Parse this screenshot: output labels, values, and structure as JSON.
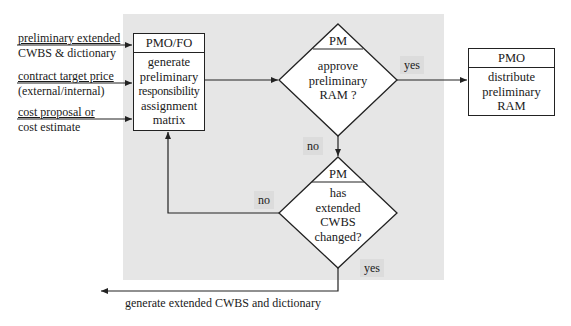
{
  "inputs": [
    {
      "line1": "preliminary extended",
      "line2": "CWBS & dictionary"
    },
    {
      "line1": "contract target price",
      "line2": "(external/internal)"
    },
    {
      "line1": "cost proposal or",
      "line2": "cost estimate"
    }
  ],
  "process_box": {
    "role": "PMO/FO",
    "lines": [
      "generate",
      "preliminary",
      "responsibility",
      "assignment",
      "matrix"
    ]
  },
  "decision_approve": {
    "role": "PM",
    "lines": [
      "approve",
      "preliminary",
      "RAM ?"
    ],
    "yes_label": "yes",
    "no_label": "no"
  },
  "decision_changed": {
    "role": "PM",
    "lines": [
      "has",
      "extended",
      "CWBS",
      "changed?"
    ],
    "yes_label": "yes",
    "no_label": "no"
  },
  "output_box": {
    "role": "PMO",
    "lines": [
      "distribute",
      "preliminary",
      "RAM"
    ]
  },
  "output_arrow_label": "generate extended CWBS and dictionary",
  "colors": {
    "shaded_region": "#e6e6e6",
    "label_background": "#dcdcdc",
    "stroke": "#222222"
  }
}
